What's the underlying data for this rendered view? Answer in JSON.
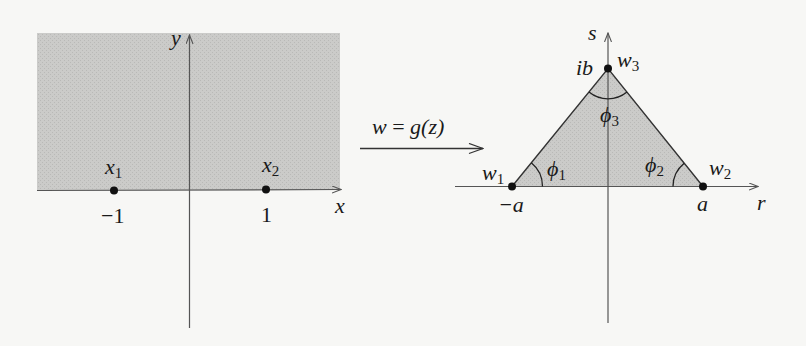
{
  "figure": {
    "background": "#f7f7f5",
    "shade_color": "#c9c9c7",
    "left_panel": {
      "plane": "z-plane",
      "region": "upper half-plane (shaded)",
      "x_axis_label": "x",
      "y_axis_label": "y",
      "points": [
        {
          "label": "x",
          "subscript": "1",
          "value_label": "−1"
        },
        {
          "label": "x",
          "subscript": "2",
          "value_label": "1"
        }
      ]
    },
    "mapping": {
      "label": "w = g(z)",
      "lhs": "w",
      "eq": " = ",
      "rhs": "g(z)"
    },
    "right_panel": {
      "plane": "w-plane",
      "region": "triangle (shaded)",
      "r_axis_label": "r",
      "s_axis_label": "s",
      "vertices": [
        {
          "label": "w",
          "subscript": "1",
          "value_label": "−a",
          "angle": "ϕ",
          "angle_sub": "1"
        },
        {
          "label": "w",
          "subscript": "2",
          "value_label": "a",
          "angle": "ϕ",
          "angle_sub": "2"
        },
        {
          "label": "w",
          "subscript": "3",
          "value_label": "ib",
          "angle": "ϕ",
          "angle_sub": "3"
        }
      ]
    }
  }
}
